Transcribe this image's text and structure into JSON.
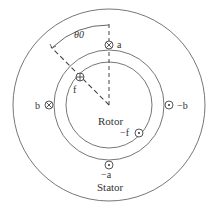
{
  "diagram": {
    "labels": {
      "rotor": "Rotor",
      "stator": "Stator",
      "angle": "θ0",
      "coil_a": "a",
      "coil_neg_a": "−a",
      "coil_b": "b",
      "coil_neg_b": "−b",
      "coil_f": "f",
      "coil_neg_f": "−f"
    },
    "conductors": [
      {
        "name": "a",
        "symbol": "cross-into-page"
      },
      {
        "name": "-a",
        "symbol": "dot-out-of-page"
      },
      {
        "name": "b",
        "symbol": "cross-into-page"
      },
      {
        "name": "-b",
        "symbol": "dot-out-of-page"
      },
      {
        "name": "f",
        "symbol": "plus-into-page"
      },
      {
        "name": "-f",
        "symbol": "dot-out-of-page"
      }
    ],
    "colors": {
      "stroke": "#555555",
      "text": "#333333",
      "background": "#ffffff"
    }
  }
}
